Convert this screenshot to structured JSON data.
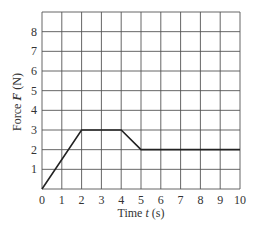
{
  "chart_data": {
    "type": "line",
    "title": "",
    "xlabel": "Time t (s)",
    "ylabel": "Force F (N)",
    "xlabel_parts": {
      "pre": "Time ",
      "var": "t",
      "post": " (s)"
    },
    "ylabel_parts": {
      "pre": "Force ",
      "var": "F",
      "post": " (N)"
    },
    "xlim": [
      0,
      10
    ],
    "ylim": [
      0,
      9
    ],
    "x_ticks": [
      "0",
      "1",
      "2",
      "3",
      "4",
      "5",
      "6",
      "7",
      "8",
      "9",
      "10"
    ],
    "y_ticks": [
      "1",
      "2",
      "3",
      "4",
      "5",
      "6",
      "7",
      "8"
    ],
    "grid": true,
    "legend": "none",
    "series": [
      {
        "name": "F(t)",
        "x": [
          0,
          2,
          4,
          5,
          10
        ],
        "y": [
          0,
          3,
          3,
          2,
          2
        ]
      }
    ]
  },
  "colors": {
    "grid": "#555555",
    "line": "#222222",
    "text": "#333333"
  }
}
